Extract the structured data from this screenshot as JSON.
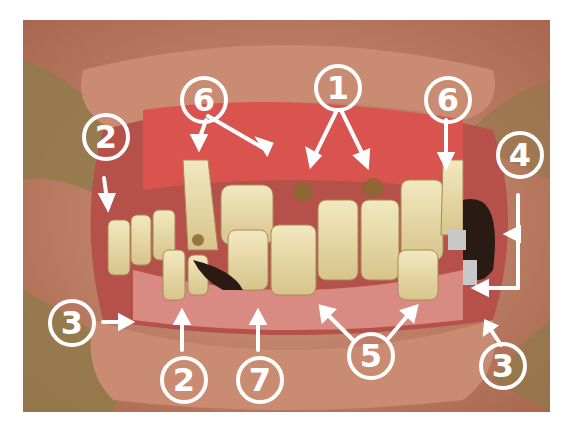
{
  "image": {
    "subject": "Intraoral clinical photograph of dentition with numbered annotations",
    "colors": {
      "skin": "#c98b72",
      "lip": "#c2706a",
      "gingiva": "#d9534f",
      "tooth": "#e8dcae",
      "metal": "#2a1a14",
      "annotation": "#ffffff"
    }
  },
  "annotations": [
    {
      "id": "label-6-left",
      "number": "6",
      "x": 202,
      "y": 98
    },
    {
      "id": "label-1",
      "number": "1",
      "x": 337,
      "y": 86
    },
    {
      "id": "label-6-right",
      "number": "6",
      "x": 446,
      "y": 98
    },
    {
      "id": "label-2-top",
      "number": "2",
      "x": 104,
      "y": 135
    },
    {
      "id": "label-4",
      "number": "4",
      "x": 518,
      "y": 153
    },
    {
      "id": "label-3-left",
      "number": "3",
      "x": 70,
      "y": 321
    },
    {
      "id": "label-2-bottom",
      "number": "2",
      "x": 182,
      "y": 378
    },
    {
      "id": "label-7",
      "number": "7",
      "x": 258,
      "y": 378
    },
    {
      "id": "label-5",
      "number": "5",
      "x": 369,
      "y": 354
    },
    {
      "id": "label-3-right",
      "number": "3",
      "x": 501,
      "y": 364
    }
  ]
}
